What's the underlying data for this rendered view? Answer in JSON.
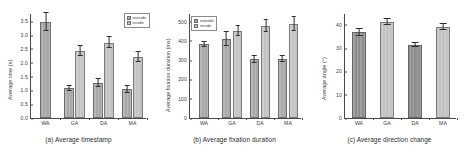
{
  "figure": {
    "background": "#ffffff",
    "bar_color_outside": "#a8a8a8",
    "bar_color_inside": "#c3c3c3",
    "bar_color_dark": "#8e8e8e",
    "bar_color_light": "#c3c3c3",
    "error_bar_color": "#2e2e2e",
    "axis_color": "#4a4a4a"
  },
  "panel_a": {
    "caption": "(a)  Average timestamp",
    "ylabel": "Average time (s)",
    "yticks": [
      "0.0",
      "0.5",
      "1.0",
      "1.5",
      "2.0",
      "2.5",
      "3.0",
      "3.5"
    ],
    "legend": {
      "outside": "outside",
      "inside": "inside"
    }
  },
  "panel_b": {
    "caption": "(b)  Average fixation duration",
    "ylabel": "Average fixation duration (ms)",
    "yticks": [
      "0",
      "100",
      "200",
      "300",
      "400",
      "500"
    ],
    "legend": {
      "outside": "outside",
      "inside": "inside"
    }
  },
  "panel_c": {
    "caption": "(c)  Average direction change",
    "ylabel": "Average angle (°)",
    "yticks": [
      "0",
      "10",
      "20",
      "30",
      "40"
    ]
  },
  "chart_data": [
    {
      "type": "bar",
      "title": "(a)  Average timestamp",
      "xlabel": "",
      "ylabel": "Average time (s)",
      "ylim": [
        0,
        3.8
      ],
      "grid": false,
      "legend_position": "upper right",
      "categories": [
        "WA",
        "GA",
        "DA",
        "MA"
      ],
      "series": [
        {
          "name": "outside",
          "values": [
            3.48,
            1.08,
            1.28,
            1.05
          ],
          "errors": [
            0.33,
            0.1,
            0.14,
            0.12
          ],
          "color": "#a8a8a8"
        },
        {
          "name": "inside",
          "values": [
            null,
            2.44,
            2.73,
            2.22
          ],
          "errors": [
            null,
            0.19,
            0.2,
            0.19
          ],
          "color": "#c3c3c3"
        }
      ]
    },
    {
      "type": "bar",
      "title": "(b)  Average fixation duration",
      "xlabel": "",
      "ylabel": "Average fixation duration (ms)",
      "ylim": [
        0,
        545
      ],
      "grid": false,
      "legend_position": "upper left",
      "categories": [
        "WA",
        "GA",
        "DA",
        "MA"
      ],
      "series": [
        {
          "name": "outside",
          "values": [
            383,
            410,
            305,
            308
          ],
          "errors": [
            15,
            35,
            17,
            15
          ],
          "color": "#a8a8a8"
        },
        {
          "name": "inside",
          "values": [
            null,
            452,
            478,
            487
          ],
          "errors": [
            null,
            25,
            30,
            36
          ],
          "color": "#c3c3c3"
        }
      ]
    },
    {
      "type": "bar",
      "title": "(c)  Average direction change",
      "xlabel": "",
      "ylabel": "Average angle (°)",
      "ylim": [
        0,
        45
      ],
      "grid": false,
      "legend_position": "none",
      "categories": [
        "WA",
        "GA",
        "DA",
        "MA"
      ],
      "values": [
        36.8,
        41.3,
        31.3,
        39.2
      ],
      "errors": [
        1.4,
        1.3,
        0.8,
        1.3
      ],
      "colors": [
        "#8e8e8e",
        "#c3c3c3",
        "#8e8e8e",
        "#c3c3c3"
      ]
    }
  ]
}
